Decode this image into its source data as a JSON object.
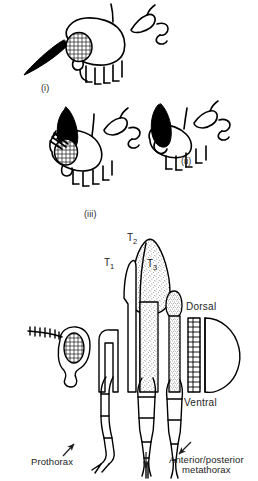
{
  "figure": {
    "kind": "scientific-illustration",
    "background_color": "#ffffff",
    "ink_color": "#000000",
    "text_color": "#1c1c1c",
    "width": 258,
    "height": 481,
    "cropped_caption_top": "partially cropped line of text at top edge"
  },
  "upper_panel": {
    "name": "upper-panel",
    "description": "three stylised cross-section outlines of insect body segments, each with a compound eye and dark filled lobe",
    "items": [
      {
        "id": "i",
        "label": "(i)",
        "eye_texture": "mesh",
        "lobe_fill": "solid-black"
      },
      {
        "id": "ii",
        "label": "(ii)",
        "eye_texture": "none",
        "lobe_fill": "solid-black"
      },
      {
        "id": "iii",
        "label": "(iii)",
        "eye_texture": "mesh",
        "lobe_fill": "solid-black"
      }
    ]
  },
  "lower_panel": {
    "name": "lower-panel",
    "description": "lateral/exploded view of head, prothorax, mesothorax and metathorax with legs and abdomen",
    "segment_labels": [
      {
        "id": "t1",
        "text": "T",
        "subscript": "1"
      },
      {
        "id": "t2",
        "text": "T",
        "subscript": "2"
      },
      {
        "id": "t3",
        "text": "T",
        "subscript": "3"
      }
    ],
    "orientation_labels": [
      {
        "id": "dorsal",
        "text": "Dorsal"
      },
      {
        "id": "ventral",
        "text": "Ventral"
      }
    ],
    "part_labels": [
      {
        "id": "prothorax",
        "text": "Prothorax",
        "has_arrow": true,
        "arrow_direction": "up-right"
      },
      {
        "id": "mesothorax",
        "text": "",
        "has_arrow": true,
        "arrow_direction": "down"
      },
      {
        "id": "metathorax",
        "line1": "Anterior/posterior",
        "line2": "metathorax",
        "has_arrow": true,
        "arrow_direction": "up-left"
      }
    ],
    "textures": {
      "eye": "mesh",
      "thoracic_plates": "stipple",
      "legs": "stipple"
    }
  }
}
